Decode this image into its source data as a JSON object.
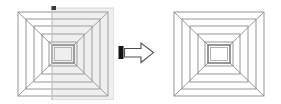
{
  "diagram": {
    "background_color": "#ffffff",
    "line_color": "#8c8c8c",
    "inner_square_color": "#6b6b6b",
    "arrow_outline_color": "#4d4d4d",
    "arrow_bar_color": "#1a1a1a",
    "overlay_color": "#b8b8b8",
    "overlay_opacity": "0.22"
  },
  "left_figure": {
    "label": "source-pyramid-with-selection-overlay",
    "caption": "",
    "outer_square": {
      "x": 4,
      "y": 6,
      "width": 90,
      "height": 84
    },
    "rings": [
      {
        "inset": 0,
        "label": "ring-0-outer"
      },
      {
        "inset": 8,
        "label": "ring-1"
      },
      {
        "inset": 16,
        "label": "ring-2"
      },
      {
        "inset": 24,
        "label": "ring-3"
      },
      {
        "inset": 32,
        "label": "ring-4"
      }
    ],
    "center_square": {
      "x": 36,
      "y": 38,
      "width": 18,
      "height": 18,
      "label": "center-aperture"
    },
    "overlay_rect": {
      "x": 38,
      "y": 2,
      "width": 62,
      "height": 92,
      "label": "selection-overlay"
    },
    "overlay_marker": {
      "x": 38,
      "y": 0,
      "width": 4,
      "height": 4,
      "label": "overlay-handle-mark"
    }
  },
  "arrow": {
    "label": "transformation-arrow",
    "direction": "right",
    "bar_label": "arrow-tail-bar",
    "head_label": "arrow-head"
  },
  "right_figure": {
    "label": "result-pyramid-clean",
    "caption": "",
    "outer_square": {
      "x": 4,
      "y": 6,
      "width": 90,
      "height": 84
    },
    "rings": [
      {
        "inset": 0,
        "label": "ring-0-outer"
      },
      {
        "inset": 8,
        "label": "ring-1"
      },
      {
        "inset": 16,
        "label": "ring-2"
      },
      {
        "inset": 24,
        "label": "ring-3"
      },
      {
        "inset": 32,
        "label": "ring-4"
      }
    ],
    "center_square": {
      "x": 36,
      "y": 38,
      "width": 18,
      "height": 18,
      "label": "center-aperture"
    }
  }
}
